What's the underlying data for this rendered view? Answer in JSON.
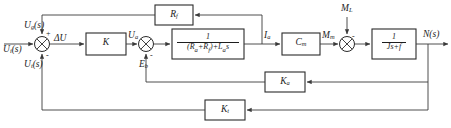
{
  "diagram": {
    "type": "control-system-block-diagram",
    "background_color": "#ffffff",
    "line_color": "#3a3a3a",
    "text_color": "#1d1d1d",
    "signals": {
      "input": "U_i(s)",
      "input_html": "U<sub>i</sub>(s)",
      "generator_feedback": "U_g(s)",
      "generator_feedback_html": "U<sub>g</sub>(s)",
      "tach_feedback": "U_t(s)",
      "tach_feedback_html": "U<sub>t</sub>(s)",
      "error": "ΔU",
      "error_html": "ΔU",
      "control_voltage": "U_a",
      "control_voltage_html": "U<sub>a</sub>",
      "back_emf": "E_b",
      "back_emf_html": "E<sub>b</sub>",
      "armature_current": "I_a",
      "armature_current_html": "I<sub>a</sub>",
      "motor_torque": "M_m",
      "motor_torque_html": "M<sub>m</sub>",
      "load_torque": "M_L",
      "load_torque_html": "M<sub>L</sub>",
      "output": "N(s)",
      "output_html": "N(s)"
    },
    "blocks": [
      {
        "id": "rf",
        "name": "generator-feedback-gain",
        "label": "R_f",
        "label_html": "R<sub>f</sub>"
      },
      {
        "id": "k",
        "name": "amplifier-gain",
        "label": "K",
        "label_html": "K"
      },
      {
        "id": "armature",
        "name": "armature-transfer-function",
        "label": "1/((R_a+R_f)+L_a s)",
        "numerator": "1",
        "denominator": "(R_a+R_f)+L_a s",
        "denominator_html": "(R<sub>a</sub>+R<sub>f</sub>)+L<sub>a</sub>s"
      },
      {
        "id": "cm",
        "name": "torque-constant",
        "label": "C_m",
        "label_html": "C<sub>m</sub>"
      },
      {
        "id": "mech",
        "name": "mechanical-transfer-function",
        "label": "1/(Js+f)",
        "numerator": "1",
        "denominator": "Js+f",
        "denominator_html": "Js+f"
      },
      {
        "id": "ka",
        "name": "back-emf-feedback-gain",
        "label": "K_a",
        "label_html": "K<sub>a</sub>"
      },
      {
        "id": "kt",
        "name": "tachometer-feedback-gain",
        "label": "K_t",
        "label_html": "K<sub>t</sub>"
      }
    ],
    "summing_junctions": [
      {
        "id": "sum1",
        "name": "input-summing-junction",
        "signs": [
          "+",
          "+",
          "-"
        ],
        "top_sign": "+",
        "bottom_sign": "-"
      },
      {
        "id": "sum2",
        "name": "back-emf-summing-junction",
        "top_sign": "-",
        "bottom_sign": "-"
      },
      {
        "id": "sum3",
        "name": "load-torque-summing-junction",
        "top_sign": "",
        "right_sign": "-"
      }
    ]
  }
}
